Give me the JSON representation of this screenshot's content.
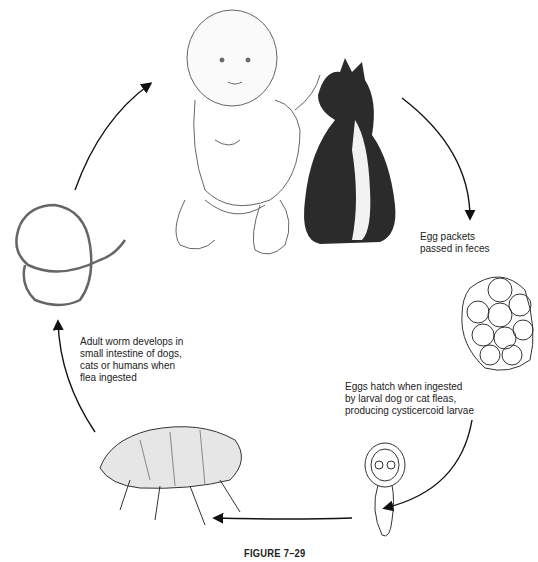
{
  "figure": {
    "caption": "FIGURE 7–29"
  },
  "stages": [
    {
      "id": "host",
      "label": "",
      "depiction": "infant-and-cat"
    },
    {
      "id": "eggs",
      "label_lines": [
        "Egg packets",
        "passed in feces"
      ],
      "depiction": "egg-packet"
    },
    {
      "id": "larva",
      "label_lines": [
        "Eggs hatch when ingested",
        "by larval dog or cat fleas,",
        "producing cysticercoid larvae"
      ],
      "depiction": "cysticercoid-larva"
    },
    {
      "id": "flea",
      "label": "",
      "depiction": "adult-flea"
    },
    {
      "id": "worm",
      "label_lines": [
        "Adult worm develops in",
        "small intestine of dogs,",
        "cats or humans when",
        "flea ingested"
      ],
      "depiction": "adult-tapeworm"
    }
  ],
  "colors": {
    "line": "#222222",
    "sketch": "#555555",
    "cat": "#2b2b2b",
    "background": "#ffffff"
  }
}
